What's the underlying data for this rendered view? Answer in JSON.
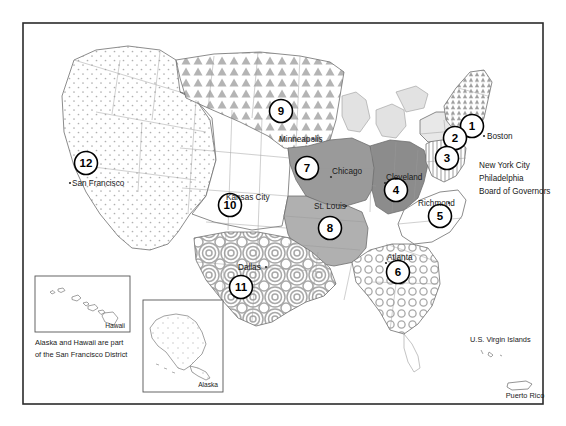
{
  "figure": {
    "frame_color": "#2b2b2b",
    "background": "#ffffff"
  },
  "districts": [
    {
      "number": "1",
      "label_x": 472,
      "label_y": 126,
      "fill": "#f0f0f0",
      "pattern": "triangle-small"
    },
    {
      "number": "2",
      "label_x": 455,
      "label_y": 138,
      "fill": "#e8e8e8",
      "pattern": "none"
    },
    {
      "number": "3",
      "label_x": 447,
      "label_y": 158,
      "fill": "#f2f2f2",
      "pattern": "vertical-hatch"
    },
    {
      "number": "4",
      "label_x": 396,
      "label_y": 190,
      "fill": "#8c8c8c",
      "pattern": "solid-dark"
    },
    {
      "number": "5",
      "label_x": 440,
      "label_y": 216,
      "fill": "#ffffff",
      "pattern": "none"
    },
    {
      "number": "6",
      "label_x": 398,
      "label_y": 272,
      "fill": "#e0e0e0",
      "pattern": "rings"
    },
    {
      "number": "7",
      "label_x": 307,
      "label_y": 168,
      "fill": "#9a9a9a",
      "pattern": "solid-mid"
    },
    {
      "number": "8",
      "label_x": 330,
      "label_y": 228,
      "fill": "#b0b0b0",
      "pattern": "solid-light"
    },
    {
      "number": "9",
      "label_x": 281,
      "label_y": 111,
      "fill": "#d8d8d8",
      "pattern": "triangles"
    },
    {
      "number": "10",
      "label_x": 230,
      "label_y": 205,
      "fill": "#ffffff",
      "pattern": "none"
    },
    {
      "number": "11",
      "label_x": 241,
      "label_y": 287,
      "fill": "#dcdcdc",
      "pattern": "spirals"
    },
    {
      "number": "12",
      "label_x": 86,
      "label_y": 163,
      "fill": "#fafafa",
      "pattern": "dots"
    }
  ],
  "cities": [
    {
      "name": "Boston",
      "x": 487,
      "y": 139,
      "anchor": "start"
    },
    {
      "name": "Minneapolis",
      "x": 279,
      "y": 142,
      "anchor": "start"
    },
    {
      "name": "Chicago",
      "x": 332,
      "y": 174,
      "anchor": "start"
    },
    {
      "name": "Cleveland",
      "x": 386,
      "y": 180,
      "anchor": "start"
    },
    {
      "name": "Richmond",
      "x": 418,
      "y": 206,
      "anchor": "start"
    },
    {
      "name": "Kansas City",
      "x": 226,
      "y": 200,
      "anchor": "start"
    },
    {
      "name": "St. Louis",
      "x": 314,
      "y": 209,
      "anchor": "start"
    },
    {
      "name": "Atlanta",
      "x": 387,
      "y": 260,
      "anchor": "start"
    },
    {
      "name": "Dallas",
      "x": 238,
      "y": 270,
      "anchor": "start"
    },
    {
      "name": "San Francisco",
      "x": 72,
      "y": 186,
      "anchor": "start"
    }
  ],
  "headquarters_block": {
    "lines": [
      "New York City",
      "Philadelphia",
      "Board of Governors"
    ],
    "x": 479,
    "y_start": 168,
    "line_height": 13
  },
  "insets": {
    "hawaii": {
      "label": "Hawaii",
      "box": {
        "x": 35,
        "y": 276,
        "w": 95,
        "h": 56
      }
    },
    "alaska": {
      "label": "Alaska",
      "box": {
        "x": 143,
        "y": 300,
        "w": 80,
        "h": 92
      }
    },
    "note": {
      "line1": "Alaska and Hawaii are part",
      "line2": "of the San Francisco District",
      "x": 35,
      "y1": 345,
      "y2": 357
    }
  },
  "territories": [
    {
      "name": "U.S. Virgin Islands",
      "x": 470,
      "y": 342,
      "anchor": "start"
    },
    {
      "name": "Puerto Rico",
      "x": 525,
      "y": 396,
      "anchor": "middle"
    }
  ],
  "colors": {
    "outline": "#555555",
    "state_line": "#9a9a9a",
    "text": "#1a1a1a",
    "district_solid_dark": "#8c8c8c",
    "district_solid_mid": "#9a9a9a",
    "district_solid_light": "#b0b0b0",
    "pattern_gray": "#b4b4b4",
    "frame": "#2b2b2b"
  }
}
